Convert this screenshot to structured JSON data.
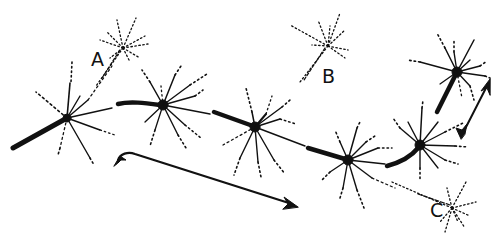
{
  "diagram": {
    "colors": {
      "ink": "#111111",
      "background": "#ffffff"
    },
    "labels": {
      "a": "A",
      "b": "B",
      "c": "C"
    },
    "chain_nodes": [
      {
        "id": "n1",
        "x": 67,
        "y": 118
      },
      {
        "id": "n2",
        "x": 163,
        "y": 105
      },
      {
        "id": "n3",
        "x": 255,
        "y": 127
      },
      {
        "id": "n4",
        "x": 348,
        "y": 160
      },
      {
        "id": "n5",
        "x": 420,
        "y": 145
      },
      {
        "id": "n6",
        "x": 457,
        "y": 72
      }
    ],
    "faint_nodes": [
      {
        "id": "a",
        "x": 123,
        "y": 48
      },
      {
        "id": "b",
        "x": 330,
        "y": 42
      },
      {
        "id": "c",
        "x": 455,
        "y": 212
      }
    ],
    "arrows": [
      {
        "id": "bottom-arrow",
        "from": [
          118,
          160
        ],
        "to": [
          298,
          206
        ]
      },
      {
        "id": "right-arrow",
        "from": [
          462,
          135
        ],
        "to": [
          490,
          80
        ]
      }
    ]
  }
}
